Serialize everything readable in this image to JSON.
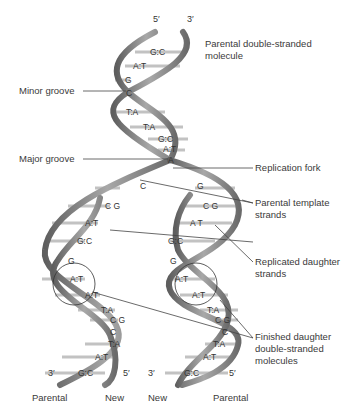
{
  "diagram": {
    "top_ends": {
      "left": "5′",
      "right": "3′"
    },
    "labels": {
      "parental_molecule": [
        "Parental double-stranded",
        "molecule"
      ],
      "minor_groove": "Minor groove",
      "major_groove": "Major groove",
      "replication_fork": "Replication fork",
      "parental_template": [
        "Parental template",
        "strands"
      ],
      "replicated_daughter": [
        "Replicated daughter",
        "strands"
      ],
      "finished_daughter": [
        "Finished daughter",
        "double-stranded",
        "molecules"
      ]
    },
    "parental_base_pairs": [
      "G:C",
      "A:T",
      "G",
      "C",
      "T:A",
      "T:A",
      "G:C",
      "A:T",
      "A"
    ],
    "left_daughter_base_pairs": [
      "C",
      "C G",
      "A:T",
      "G:C",
      "G",
      "A:T",
      "A:T",
      "T:A",
      "C G",
      "C",
      "T:A",
      "A:T",
      "G:C"
    ],
    "right_daughter_base_pairs": [
      "G",
      "C G",
      "A T",
      "G:C",
      "G",
      "A:T",
      "A:T",
      "T:A",
      "C G",
      "C",
      "T:A",
      "A:T",
      "G:C"
    ],
    "bottom_ends": {
      "left_1": "3′",
      "left_2": "5′",
      "right_1": "3′",
      "right_2": "5′"
    },
    "footer": [
      "Parental",
      "New",
      "New",
      "Parental"
    ],
    "colors": {
      "strand_dark": "#6b6b6b",
      "strand_light": "#a9a9a9",
      "rung": "#bdbdbd",
      "line": "#444444"
    }
  }
}
